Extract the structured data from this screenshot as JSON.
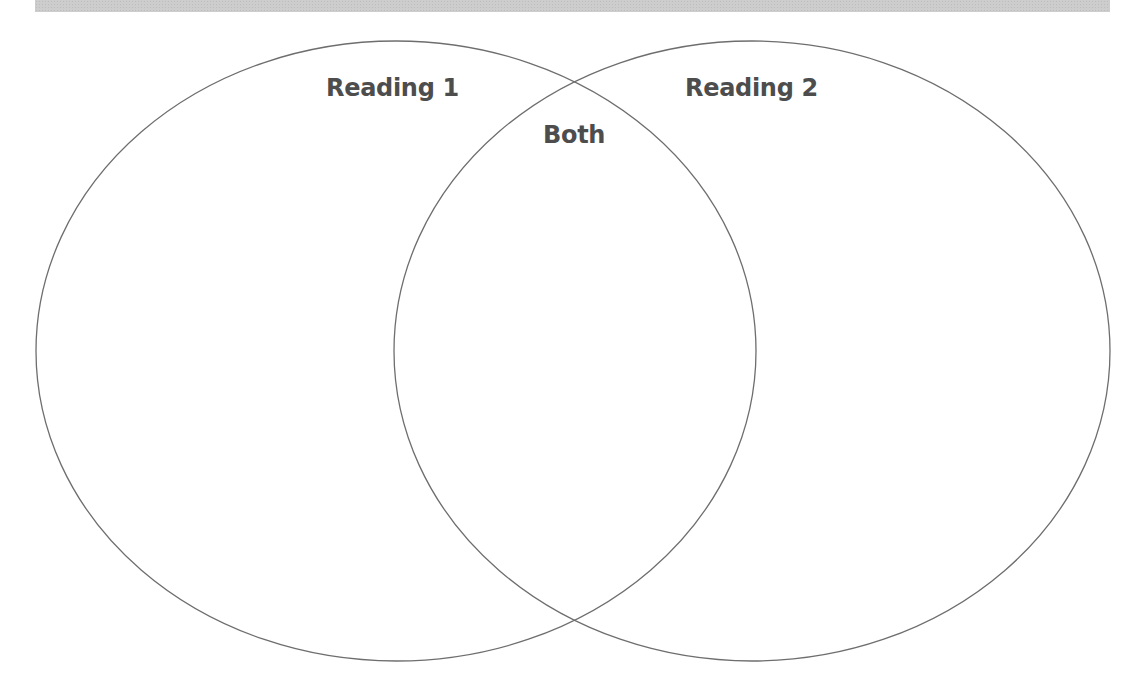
{
  "diagram": {
    "type": "venn",
    "sets": [
      {
        "id": "left",
        "label": "Reading 1"
      },
      {
        "id": "right",
        "label": "Reading 2"
      }
    ],
    "intersection_label": "Both",
    "colors": {
      "outline": "#6e6e6e",
      "label": "#4d4d4d",
      "top_band": "#cdcdcd",
      "background": "#ffffff"
    }
  },
  "labels": {
    "left": "Reading 1",
    "right": "Reading 2",
    "both": "Both"
  }
}
